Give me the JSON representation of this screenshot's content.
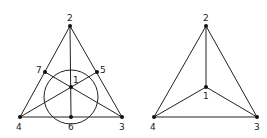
{
  "diagrams": [
    {
      "name": "fano-plane",
      "nodes": [
        {
          "id": "1",
          "x": 71,
          "y": 87,
          "label": "1",
          "lx": 73,
          "ly": 83
        },
        {
          "id": "2",
          "x": 70,
          "y": 26,
          "label": "2",
          "lx": 67,
          "ly": 21
        },
        {
          "id": "3",
          "x": 122,
          "y": 117,
          "label": "3",
          "lx": 119,
          "ly": 130
        },
        {
          "id": "4",
          "x": 20,
          "y": 117,
          "label": "4",
          "lx": 16,
          "ly": 130
        },
        {
          "id": "5",
          "x": 97,
          "y": 72,
          "label": "5",
          "lx": 100,
          "ly": 73
        },
        {
          "id": "6",
          "x": 71,
          "y": 117,
          "label": "6",
          "lx": 68,
          "ly": 130
        },
        {
          "id": "7",
          "x": 45,
          "y": 72,
          "label": "7",
          "lx": 36,
          "ly": 73
        }
      ],
      "lines": [
        [
          "2",
          "4"
        ],
        [
          "2",
          "3"
        ],
        [
          "4",
          "3"
        ],
        [
          "2",
          "6"
        ],
        [
          "4",
          "5"
        ],
        [
          "3",
          "7"
        ]
      ],
      "circle": {
        "cx": 71,
        "cy": 97,
        "r": 27
      }
    },
    {
      "name": "tetrahedron-graph",
      "nodes": [
        {
          "id": "1",
          "x": 206,
          "y": 87,
          "label": "1",
          "lx": 203,
          "ly": 99
        },
        {
          "id": "2",
          "x": 206,
          "y": 26,
          "label": "2",
          "lx": 203,
          "ly": 21
        },
        {
          "id": "3",
          "x": 257,
          "y": 117,
          "label": "3",
          "lx": 254,
          "ly": 130
        },
        {
          "id": "4",
          "x": 154,
          "y": 117,
          "label": "4",
          "lx": 150,
          "ly": 130
        }
      ],
      "lines": [
        [
          "2",
          "4"
        ],
        [
          "2",
          "3"
        ],
        [
          "4",
          "3"
        ],
        [
          "2",
          "1"
        ],
        [
          "4",
          "1"
        ],
        [
          "3",
          "1"
        ]
      ]
    }
  ]
}
